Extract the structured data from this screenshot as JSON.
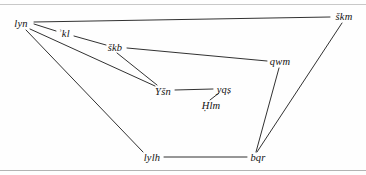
{
  "figure": {
    "type": "semantic-network-diagram",
    "background_color": "#fefefe",
    "line_color": "#1a1a1a",
    "text_color": "#121212",
    "rules": [
      {
        "name": "top-rule",
        "y": 4,
        "color": "#9a9a9a"
      },
      {
        "name": "bottom-rule",
        "y": 170,
        "color": "#9a9a9a"
      }
    ]
  },
  "nodes": [
    {
      "id": "lyn",
      "label": "lyn",
      "x": 21,
      "y": 23
    },
    {
      "id": "kl",
      "label": "ʾkl",
      "x": 64,
      "y": 33
    },
    {
      "id": "skb",
      "label": "škb",
      "x": 115,
      "y": 47
    },
    {
      "id": "skm",
      "label": "škm",
      "x": 344,
      "y": 16
    },
    {
      "id": "qwm",
      "label": "qwm",
      "x": 280,
      "y": 61
    },
    {
      "id": "ysn",
      "label": "Yšn",
      "x": 163,
      "y": 91
    },
    {
      "id": "yqs",
      "label": "yqṣ",
      "x": 224,
      "y": 89
    },
    {
      "id": "hlm",
      "label": "Ḥlm",
      "x": 211,
      "y": 105
    },
    {
      "id": "lylh",
      "label": "lylh",
      "x": 152,
      "y": 157
    },
    {
      "id": "bqr",
      "label": "bqr",
      "x": 258,
      "y": 157
    }
  ],
  "edges": [
    {
      "from": "lyn",
      "to": "skm",
      "x1": 34,
      "y1": 22,
      "x2": 330,
      "y2": 17
    },
    {
      "from": "lyn",
      "to": "kl",
      "x1": 34,
      "y1": 24,
      "x2": 56,
      "y2": 31
    },
    {
      "from": "kl",
      "to": "skb",
      "x1": 74,
      "y1": 36,
      "x2": 106,
      "y2": 45
    },
    {
      "from": "skb",
      "to": "qwm",
      "x1": 127,
      "y1": 48,
      "x2": 267,
      "y2": 61
    },
    {
      "from": "lyn",
      "to": "ysn",
      "x1": 30,
      "y1": 29,
      "x2": 155,
      "y2": 86
    },
    {
      "from": "skb",
      "to": "ysn",
      "x1": 117,
      "y1": 53,
      "x2": 157,
      "y2": 85
    },
    {
      "from": "ysn",
      "to": "yqs",
      "x1": 175,
      "y1": 90,
      "x2": 213,
      "y2": 89
    },
    {
      "from": "yqs",
      "to": "hlm",
      "x1": 219,
      "y1": 93,
      "x2": 210,
      "y2": 100
    },
    {
      "from": "lyn",
      "to": "lylh",
      "x1": 26,
      "y1": 30,
      "x2": 143,
      "y2": 152
    },
    {
      "from": "lylh",
      "to": "bqr",
      "x1": 164,
      "y1": 157,
      "x2": 247,
      "y2": 157
    },
    {
      "from": "qwm",
      "to": "bqr",
      "x1": 279,
      "y1": 68,
      "x2": 256,
      "y2": 152
    },
    {
      "from": "skm",
      "to": "bqr",
      "x1": 342,
      "y1": 23,
      "x2": 257,
      "y2": 152
    }
  ]
}
